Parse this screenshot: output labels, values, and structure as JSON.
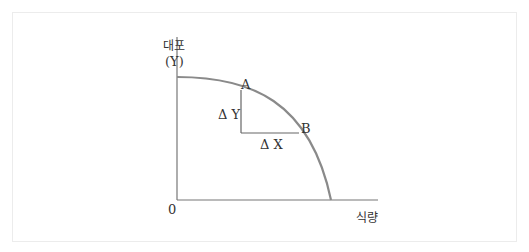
{
  "diagram": {
    "type": "production-possibility-frontier",
    "y_axis_label_line1": "대포",
    "y_axis_label_line2": "(Y)",
    "x_axis_label": "식량",
    "origin_label": "0",
    "point_a_label": "A",
    "point_b_label": "B",
    "delta_y_label": "Δ Y",
    "delta_x_label": "Δ X",
    "colors": {
      "curve": "#8a8a8a",
      "axes": "#777777",
      "text": "#333333"
    }
  }
}
